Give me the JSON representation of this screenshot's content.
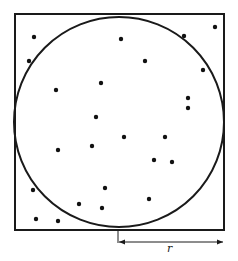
{
  "diagram": {
    "title": "",
    "square": {
      "x": 15,
      "y": 14,
      "width": 209,
      "height": 216
    },
    "circle": {
      "cx": 119,
      "cy": 122,
      "r": 105
    },
    "radius_label": "r",
    "radius_arrow": {
      "x1": 119,
      "x2": 223,
      "y": 242,
      "tick_top": 230
    },
    "stroke_color": "#1a1a1a",
    "points": [
      [
        34,
        37
      ],
      [
        121,
        39
      ],
      [
        184,
        36
      ],
      [
        215,
        27
      ],
      [
        29,
        61
      ],
      [
        145,
        61
      ],
      [
        203,
        70
      ],
      [
        101,
        83
      ],
      [
        56,
        90
      ],
      [
        188,
        98
      ],
      [
        188,
        108
      ],
      [
        96,
        117
      ],
      [
        124,
        137
      ],
      [
        165,
        137
      ],
      [
        58,
        150
      ],
      [
        92,
        146
      ],
      [
        154,
        160
      ],
      [
        172,
        162
      ],
      [
        33,
        190
      ],
      [
        105,
        188
      ],
      [
        149,
        199
      ],
      [
        79,
        204
      ],
      [
        102,
        208
      ],
      [
        36,
        219
      ],
      [
        58,
        221
      ]
    ]
  }
}
